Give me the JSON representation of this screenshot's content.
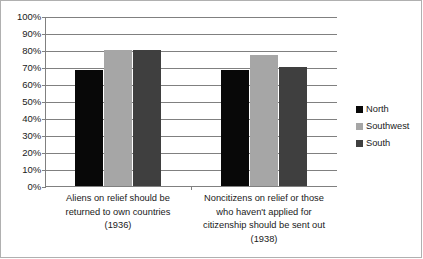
{
  "chart_data": {
    "type": "bar",
    "title": "",
    "subtitle": "",
    "xlabel": "",
    "ylabel": "",
    "ylim": [
      0,
      100
    ],
    "grid": true,
    "legend_position": "right",
    "y_tick_labels": [
      "100%",
      "90%",
      "80%",
      "70%",
      "60%",
      "50%",
      "40%",
      "30%",
      "20%",
      "10%",
      "0%"
    ],
    "y_tick_values": [
      100,
      90,
      80,
      70,
      60,
      50,
      40,
      30,
      20,
      10,
      0
    ],
    "categories": [
      "Aliens on relief should be returned to own countries (1936)",
      "Noncitizens on relief or those who haven't applied for citizenship should be sent out (1938)"
    ],
    "category_label_lines": [
      [
        "Aliens on relief should be",
        "returned to own countries",
        "(1936)"
      ],
      [
        "Noncitizens on relief or those",
        "who haven't applied for",
        "citizenship should be sent out",
        "(1938)"
      ]
    ],
    "series": [
      {
        "name": "North",
        "color": "#080808",
        "values": [
          68,
          68
        ]
      },
      {
        "name": "Southwest",
        "color": "#a6a6a6",
        "values": [
          80,
          77
        ]
      },
      {
        "name": "South",
        "color": "#3f3f3f",
        "values": [
          80,
          70
        ]
      }
    ]
  },
  "legend": {
    "items": [
      {
        "label": "North",
        "color": "#080808"
      },
      {
        "label": "Southwest",
        "color": "#a6a6a6"
      },
      {
        "label": "South",
        "color": "#3f3f3f"
      }
    ]
  }
}
